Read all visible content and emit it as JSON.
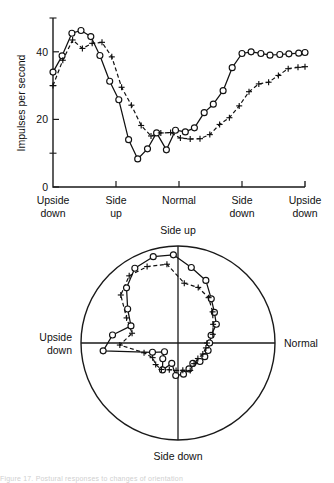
{
  "figure": {
    "background_color": "#ffffff",
    "ink_color": "#111111",
    "caption_fragment": "Figure 17. Postural responses to changes of orientation"
  },
  "chart_data": [
    {
      "id": "cartesian-plot",
      "type": "line",
      "title": "",
      "xlabel": "",
      "ylabel": "Impulses per second",
      "ylim": [
        0,
        50
      ],
      "yticks": [
        0,
        20,
        40
      ],
      "ytick_labels": [
        "0",
        "20",
        "40"
      ],
      "yminor_ticks": [
        10,
        30,
        50
      ],
      "grid": false,
      "legend_position": "none",
      "xlim": [
        0,
        360
      ],
      "xtick_positions": [
        0,
        90,
        180,
        270,
        360
      ],
      "categories": [
        "Upside down",
        "Side up",
        "Normal",
        "Side down",
        "Upside down"
      ],
      "series": [
        {
          "name": "circles",
          "marker": "open-circle",
          "linestyle": "solid",
          "x": [
            0,
            13,
            27,
            40,
            54,
            67,
            81,
            94,
            108,
            121,
            135,
            148,
            162,
            175,
            189,
            202,
            216,
            229,
            243,
            256,
            270,
            283,
            297,
            310,
            324,
            337,
            351,
            360
          ],
          "y": [
            34.0,
            38.8,
            45.5,
            46.3,
            44.5,
            38.9,
            31.3,
            25.8,
            14.0,
            8.3,
            11.3,
            16.0,
            11.0,
            16.8,
            16.3,
            17.5,
            22.0,
            24.5,
            28.5,
            35.3,
            39.5,
            40.0,
            39.5,
            39.0,
            39.2,
            39.4,
            39.6,
            39.8
          ]
        },
        {
          "name": "crosses",
          "marker": "plus",
          "linestyle": "dashed",
          "x": [
            0,
            14,
            28,
            42,
            56,
            70,
            84,
            98,
            112,
            126,
            140,
            154,
            168,
            182,
            196,
            210,
            224,
            238,
            252,
            266,
            280,
            294,
            308,
            322,
            336,
            350,
            360
          ],
          "y": [
            30.0,
            37.5,
            43.5,
            41.0,
            42.5,
            42.8,
            38.5,
            29.5,
            24.2,
            18.2,
            15.1,
            16.0,
            16.1,
            14.5,
            14.2,
            14.3,
            15.5,
            18.5,
            20.5,
            24.0,
            28.2,
            30.5,
            31.0,
            33.0,
            35.0,
            35.4,
            35.6
          ]
        }
      ]
    },
    {
      "id": "polar-plot",
      "type": "line",
      "polar": true,
      "title": "",
      "rlim": [
        0,
        50
      ],
      "grid": false,
      "legend_position": "none",
      "angle_labels": [
        {
          "label": "Side up",
          "angle_deg": 90
        },
        {
          "label": "Normal",
          "angle_deg": 0
        },
        {
          "label": "Side down",
          "angle_deg": 270
        },
        {
          "label": "Upside down",
          "angle_deg": 180
        }
      ],
      "series": [
        {
          "name": "circles",
          "marker": "open-circle",
          "linestyle": "solid",
          "theta_deg": [
            0,
            13,
            26,
            40,
            53,
            66,
            80,
            93,
            106,
            120,
            133,
            146,
            160,
            173,
            186,
            200,
            213,
            226,
            240,
            253,
            266,
            280,
            293,
            306,
            320,
            333,
            346
          ],
          "r": [
            16.3,
            17.5,
            22.0,
            24.5,
            28.5,
            35.3,
            39.5,
            45.5,
            46.3,
            44.5,
            38.9,
            31.3,
            25.8,
            34.0,
            38.8,
            14.0,
            8.3,
            11.3,
            16.0,
            11.0,
            16.8,
            16.3,
            14.5,
            13.0,
            14.8,
            15.5,
            16.0
          ]
        },
        {
          "name": "crosses",
          "marker": "plus",
          "linestyle": "dashed",
          "theta_deg": [
            0,
            14,
            28,
            42,
            56,
            70,
            84,
            98,
            112,
            126,
            140,
            154,
            168,
            182,
            196,
            210,
            224,
            238,
            252,
            266,
            280,
            294,
            308,
            322,
            336,
            350
          ],
          "r": [
            15.0,
            18.5,
            20.5,
            24.0,
            28.2,
            30.5,
            31.0,
            41.0,
            42.5,
            42.8,
            38.5,
            29.5,
            24.2,
            30.0,
            18.2,
            15.1,
            16.0,
            16.1,
            14.5,
            14.2,
            14.3,
            15.5,
            13.5,
            13.0,
            14.0,
            14.6
          ]
        }
      ]
    }
  ]
}
